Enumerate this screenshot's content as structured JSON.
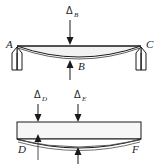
{
  "figure": {
    "background_color": "#ffffff",
    "line_color": "#1a1a1a",
    "secondary_line_color": "#4d4d4d",
    "width": 158,
    "height": 164
  },
  "top_panel": {
    "name": "simply-supported-beam-deflection",
    "description": "Simply supported beam A-C on two column supports, sagging under central load",
    "labels": {
      "left_support": "A",
      "right_support": "C",
      "center_reaction": "B",
      "applied_deflection_symbol": "Δ",
      "applied_deflection_subscript": "B"
    }
  },
  "bottom_panel": {
    "name": "beam-with-two-deflections",
    "description": "Rectangular beam D-F with deflected shape below, two downward deflection arrows",
    "labels": {
      "left_end": "D",
      "right_end": "F",
      "deflection_1_symbol": "Δ",
      "deflection_1_subscript": "D",
      "deflection_2_symbol": "Δ",
      "deflection_2_subscript": "E"
    }
  },
  "annotations": {
    "arrow_down_top": "down-arrow",
    "arrow_up_center": "up-arrow",
    "support_left": "column-support",
    "support_right": "column-support"
  }
}
